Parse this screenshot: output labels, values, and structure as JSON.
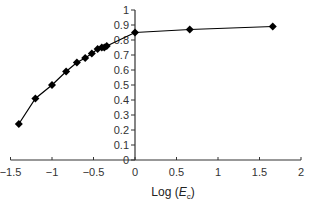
{
  "chart_data": {
    "type": "line",
    "title": "",
    "xlabel": "Log (E_c)",
    "xlabel_main": "Log (",
    "xlabel_var": "E",
    "xlabel_sub": "c",
    "xlabel_close": ")",
    "ylabel": "",
    "xlim": [
      -1.5,
      2
    ],
    "ylim": [
      0,
      1
    ],
    "xticks": [
      "-1.5",
      "-1",
      "-0.5",
      "0",
      "0.5",
      "1",
      "1.5",
      "2"
    ],
    "xtick_values": [
      -1.5,
      -1,
      -0.5,
      0,
      0.5,
      1,
      1.5,
      2
    ],
    "yticks": [
      "0",
      "0.1",
      "0.2",
      "0.3",
      "0.4",
      "0.5",
      "0.6",
      "0.7",
      "0.8",
      "0.9",
      "1"
    ],
    "ytick_values": [
      0,
      0.1,
      0.2,
      0.3,
      0.4,
      0.5,
      0.6,
      0.7,
      0.8,
      0.9,
      1
    ],
    "grid": false,
    "legend": null,
    "marker": "diamond",
    "series": [
      {
        "name": "series-1",
        "color": "#000000",
        "x": [
          -1.4,
          -1.2,
          -1.0,
          -0.83,
          -0.7,
          -0.6,
          -0.52,
          -0.45,
          -0.4,
          -0.37,
          -0.34,
          0.0,
          0.66,
          1.66
        ],
        "y": [
          0.24,
          0.41,
          0.5,
          0.59,
          0.65,
          0.68,
          0.71,
          0.74,
          0.75,
          0.75,
          0.76,
          0.85,
          0.87,
          0.89
        ]
      }
    ]
  }
}
